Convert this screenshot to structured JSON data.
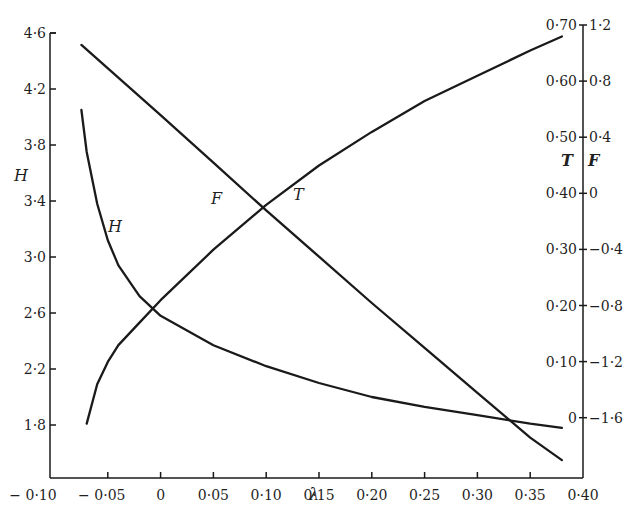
{
  "chart_data": {
    "type": "line",
    "title": "",
    "xlabel": "λ",
    "x_ticks": [
      "− 0·10",
      "− 0·05",
      "0",
      "0·05",
      "0·10",
      "0·15",
      "0·20",
      "0·25",
      "0·30",
      "0·35",
      "0·40"
    ],
    "xlim": [
      -0.1,
      0.4
    ],
    "y_axes": {
      "left": {
        "label": "H",
        "ticks": [
          "4·6",
          "4·2",
          "3·8",
          "3·4",
          "3·0",
          "2·6",
          "2·2",
          "1·8"
        ],
        "range": [
          1.8,
          4.6
        ]
      },
      "right_T": {
        "label": "T",
        "ticks": [
          "0·70",
          "0·60",
          "0·50",
          "0·40",
          "0·30",
          "0·20",
          "0·10",
          "0"
        ],
        "range": [
          0,
          0.7
        ]
      },
      "right_F": {
        "label": "F",
        "ticks": [
          "1·2",
          "0·8",
          "0·4",
          "0",
          "−0·4",
          "−0·8",
          "−1·2",
          "−1·6"
        ],
        "range": [
          -1.6,
          1.2
        ]
      }
    },
    "grid": false,
    "legend": "none (curves labelled inline H, F, T)",
    "series": [
      {
        "name": "H",
        "axis": "left",
        "x": [
          -0.075,
          -0.07,
          -0.06,
          -0.05,
          -0.04,
          -0.02,
          0.0,
          0.05,
          0.1,
          0.15,
          0.2,
          0.25,
          0.3,
          0.35,
          0.38
        ],
        "values": [
          4.05,
          3.75,
          3.38,
          3.12,
          2.94,
          2.72,
          2.58,
          2.37,
          2.22,
          2.1,
          2.0,
          1.93,
          1.87,
          1.81,
          1.78
        ]
      },
      {
        "name": "F",
        "axis": "right_F",
        "x": [
          -0.075,
          0.0,
          0.05,
          0.1,
          0.15,
          0.2,
          0.25,
          0.3,
          0.35,
          0.38
        ],
        "values": [
          1.06,
          0.56,
          0.22,
          -0.12,
          -0.45,
          -0.78,
          -1.1,
          -1.42,
          -1.74,
          -1.9
        ]
      },
      {
        "name": "T",
        "axis": "right_T",
        "x": [
          -0.07,
          -0.06,
          -0.05,
          -0.04,
          -0.02,
          0.0,
          0.05,
          0.1,
          0.15,
          0.2,
          0.25,
          0.3,
          0.35,
          0.38
        ],
        "values": [
          -0.01,
          0.06,
          0.1,
          0.13,
          0.17,
          0.21,
          0.3,
          0.38,
          0.45,
          0.51,
          0.565,
          0.61,
          0.655,
          0.68
        ]
      }
    ],
    "annotations": [
      {
        "text": "H",
        "near_series": "H"
      },
      {
        "text": "F",
        "near_series": "F"
      },
      {
        "text": "T",
        "near_series": "T"
      }
    ]
  },
  "labels": {
    "x_axis_title": "λ",
    "left_axis_title": "H",
    "right_T_title": "T",
    "right_F_title": "F",
    "curve_H": "H",
    "curve_F": "F",
    "curve_T": "T"
  }
}
